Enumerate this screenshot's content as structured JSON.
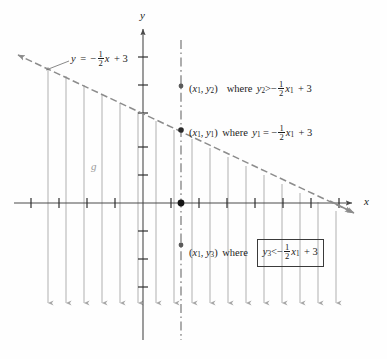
{
  "figure": {
    "type": "coordinate-graph-linear-inequality",
    "axes": {
      "x_label": "x",
      "y_label": "y",
      "x_axis_y_px": 203,
      "y_axis_x_px": 143,
      "tick_spacing_px": 28,
      "grid": false
    },
    "line": {
      "equation_label_parts": {
        "lhs": "y",
        "equals": "=",
        "minus": "−",
        "numerator": "1",
        "denominator": "2",
        "variable": "x",
        "plus": "+",
        "constant": "3"
      },
      "equation_plain": "y = -1/2 x + 3",
      "slope": -0.5,
      "intercept": 3,
      "style": "dashed",
      "color": "#8c8c8c",
      "arrows": "both"
    },
    "function_name": "g",
    "vertical_dashed_line": {
      "label": "x = x1",
      "x_px": 181,
      "color": "#8a8a8a",
      "style": "dash-dot"
    },
    "shading": {
      "direction": "down",
      "description": "downward arrows below the line indicating y < -1/2 x + 3",
      "arrow_count": 17,
      "color": "#a8a8a8"
    },
    "points": [
      {
        "id": "p2",
        "label_parts": {
          "open": "(",
          "x": "x",
          "xsub": "1",
          "comma": ",",
          "y": "y",
          "ysub": "2",
          "close": ")"
        },
        "where": "where",
        "relation_lhs_var": "y",
        "relation_lhs_sub": "2",
        "relation_op": ">",
        "relation_rhs_plain": "-1/2 x1 + 3",
        "plain": "(x1, y2) where y2 > -1/2 x1 + 3",
        "boxed": false,
        "x_px": 181,
        "y_px": 86
      },
      {
        "id": "p1",
        "label_parts": {
          "open": "(",
          "x": "x",
          "xsub": "1",
          "comma": ",",
          "y": "y",
          "ysub": "1",
          "close": ")"
        },
        "where": "where",
        "relation_lhs_var": "y",
        "relation_lhs_sub": "1",
        "relation_op": "=",
        "relation_rhs_plain": "-1/2 x1 + 3",
        "plain": "(x1, y1) where y1 = -1/2 x1 + 3",
        "boxed": false,
        "x_px": 181,
        "y_px": 130
      },
      {
        "id": "p3",
        "label_parts": {
          "open": "(",
          "x": "x",
          "xsub": "1",
          "comma": ",",
          "y": "y",
          "ysub": "3",
          "close": ")"
        },
        "where": "where",
        "relation_lhs_var": "y",
        "relation_lhs_sub": "3",
        "relation_op": "<",
        "relation_rhs_plain": "-1/2 x1 + 3",
        "plain": "(x1, y3) where y3 < -1/2 x1 + 3",
        "boxed": true,
        "x_px": 181,
        "y_px": 245
      },
      {
        "id": "origin-ish",
        "plain": "point on x-axis at x1",
        "x_px": 181,
        "y_px": 203
      }
    ],
    "symbols": {
      "minus": "−",
      "plus": "+",
      "equals": "=",
      "greater": ">",
      "less": "<",
      "comma": ","
    },
    "colors": {
      "line": "#8c8c8c",
      "axis": "#4a4a4a",
      "hatch": "#a8a8a8",
      "text": "#1b1b1b",
      "dashed_vertical": "#8a8a8a",
      "function_label": "#9a9a9a",
      "box_border": "#3a3a3a"
    }
  }
}
